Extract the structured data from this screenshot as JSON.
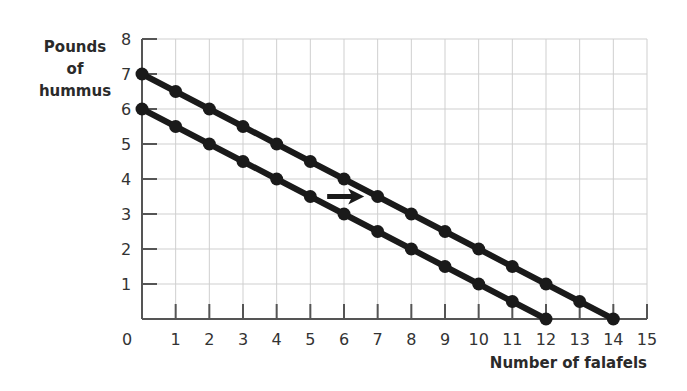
{
  "chart_data": {
    "type": "line",
    "title": "",
    "xlabel": "Number of falafels",
    "ylabel_lines": [
      "Pounds",
      "of",
      "hummus"
    ],
    "xlim": [
      0,
      15
    ],
    "ylim": [
      0,
      8
    ],
    "x_ticks": [
      0,
      1,
      2,
      3,
      4,
      5,
      6,
      7,
      8,
      9,
      10,
      11,
      12,
      13,
      14,
      15
    ],
    "y_ticks": [
      1,
      2,
      3,
      4,
      5,
      6,
      7,
      8
    ],
    "grid": true,
    "legend": "none",
    "series": [
      {
        "name": "original budget line",
        "x": [
          0,
          1,
          2,
          3,
          4,
          5,
          6,
          7,
          8,
          9,
          10,
          11,
          12
        ],
        "y": [
          6,
          5.5,
          5,
          4.5,
          4,
          3.5,
          3,
          2.5,
          2,
          1.5,
          1,
          0.5,
          0
        ]
      },
      {
        "name": "shifted budget line",
        "x": [
          0,
          1,
          2,
          3,
          4,
          5,
          6,
          7,
          8,
          9,
          10,
          11,
          12,
          13,
          14
        ],
        "y": [
          7,
          6.5,
          6,
          5.5,
          5,
          4.5,
          4,
          3.5,
          3,
          2.5,
          2,
          1.5,
          1,
          0.5,
          0
        ]
      }
    ],
    "annotations": [
      {
        "type": "arrow",
        "direction": "right",
        "from": [
          5.5,
          3.5
        ],
        "to": [
          6.6,
          3.5
        ],
        "meaning": "outward shift of budget line"
      }
    ],
    "colors": {
      "line": "#1a1a1a",
      "grid": "#cfcfcf",
      "axis": "#555555"
    }
  }
}
